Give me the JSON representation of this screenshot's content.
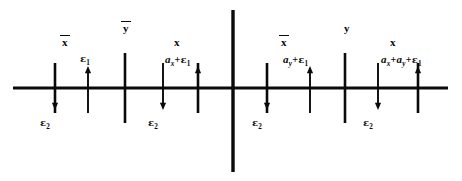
{
  "figure": {
    "background_color": "#ffffff",
    "ink_color": "#0a0a0a",
    "width": 462,
    "height": 181
  },
  "axis": {
    "baseline_y": 88,
    "x_start": 13,
    "x_end": 448,
    "center_divider_x": 233,
    "center_divider_top": 10,
    "center_divider_bottom": 172
  },
  "ticks": [
    {
      "name": "x-bar-tick-left",
      "x": 55,
      "top": 63,
      "bottom": 113
    },
    {
      "name": "y-bar-tick",
      "x": 125,
      "top": 53,
      "bottom": 123
    },
    {
      "name": "x-tick-left",
      "x": 198,
      "top": 63,
      "bottom": 113
    },
    {
      "name": "x-bar-tick-right",
      "x": 267,
      "top": 63,
      "bottom": 113
    },
    {
      "name": "y-tick",
      "x": 345,
      "top": 53,
      "bottom": 123
    },
    {
      "name": "x-tick-right",
      "x": 418,
      "top": 63,
      "bottom": 113
    }
  ],
  "arrows": {
    "down": [
      {
        "name": "epsilon2-arrow-1",
        "x": 55,
        "from_y": 63,
        "to_y": 110
      },
      {
        "name": "epsilon2-arrow-2",
        "x": 163,
        "from_y": 63,
        "to_y": 110
      },
      {
        "name": "epsilon2-arrow-3",
        "x": 267,
        "from_y": 63,
        "to_y": 110
      },
      {
        "name": "epsilon2-arrow-4",
        "x": 378,
        "from_y": 63,
        "to_y": 110
      }
    ],
    "up": [
      {
        "name": "epsilon1-arrow-1",
        "x": 88,
        "from_y": 113,
        "to_y": 66
      },
      {
        "name": "epsilon1-arrow-2",
        "x": 198,
        "from_y": 113,
        "to_y": 66
      },
      {
        "name": "epsilon1-arrow-3",
        "x": 310,
        "from_y": 113,
        "to_y": 66
      },
      {
        "name": "epsilon1-arrow-4",
        "x": 418,
        "from_y": 113,
        "to_y": 66
      }
    ]
  },
  "labels": {
    "variables": [
      {
        "name": "label-x-bar-left",
        "text": "x",
        "overline": true,
        "x": 62,
        "y": 37
      },
      {
        "name": "label-y-bar",
        "text": "y",
        "overline": true,
        "x": 123,
        "y": 23
      },
      {
        "name": "label-x-left",
        "text": "x",
        "overline": false,
        "x": 174,
        "y": 37
      },
      {
        "name": "label-x-bar-right",
        "text": "x",
        "overline": true,
        "x": 281,
        "y": 37
      },
      {
        "name": "label-y-right",
        "text": "y",
        "overline": false,
        "x": 344,
        "y": 23
      },
      {
        "name": "label-x-right",
        "text": "x",
        "overline": false,
        "x": 390,
        "y": 37
      }
    ],
    "epsilon1_label": "ε",
    "epsilon1_sub": "1",
    "epsilon2_label": "ε",
    "epsilon2_sub": "2",
    "expressions": [
      {
        "name": "expr-epsilon1",
        "x": 80,
        "y": 54,
        "parts": [
          {
            "kind": "eps",
            "text": "ε",
            "sub": "1"
          }
        ]
      },
      {
        "name": "expr-ax-plus-epsilon1",
        "x": 165,
        "y": 54,
        "parts": [
          {
            "kind": "a",
            "text": "a",
            "sub": "x"
          },
          {
            "kind": "plus",
            "text": "+"
          },
          {
            "kind": "eps",
            "text": "ε",
            "sub": "1"
          }
        ]
      },
      {
        "name": "expr-ay-plus-epsilon1",
        "x": 283,
        "y": 54,
        "parts": [
          {
            "kind": "a",
            "text": "a",
            "sub": "y"
          },
          {
            "kind": "plus",
            "text": "+"
          },
          {
            "kind": "eps",
            "text": "ε",
            "sub": "1"
          }
        ]
      },
      {
        "name": "expr-ax-plus-ay-plus-epsilon1",
        "x": 381,
        "y": 54,
        "parts": [
          {
            "kind": "a",
            "text": "a",
            "sub": "x"
          },
          {
            "kind": "plus",
            "text": "+"
          },
          {
            "kind": "a",
            "text": "a",
            "sub": "y"
          },
          {
            "kind": "plus",
            "text": "+"
          },
          {
            "kind": "eps",
            "text": "ε",
            "sub": "1"
          }
        ]
      }
    ],
    "epsilon2_positions": [
      {
        "name": "label-epsilon2-1",
        "x": 40,
        "y": 118
      },
      {
        "name": "label-epsilon2-2",
        "x": 148,
        "y": 118
      },
      {
        "name": "label-epsilon2-3",
        "x": 252,
        "y": 118
      },
      {
        "name": "label-epsilon2-4",
        "x": 363,
        "y": 118
      }
    ]
  }
}
